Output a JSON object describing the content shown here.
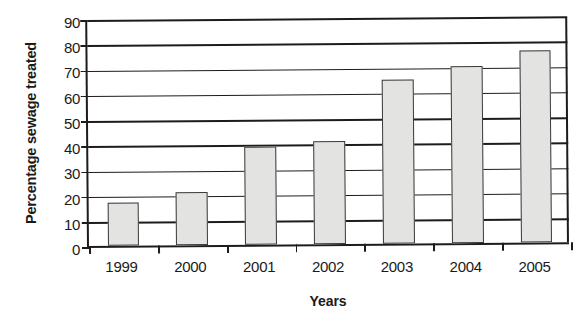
{
  "chart_data": {
    "type": "bar",
    "title": "",
    "xlabel": "Years",
    "ylabel": "Percentage sewage treated",
    "categories": [
      "1999",
      "2000",
      "2001",
      "2002",
      "2003",
      "2004",
      "2005"
    ],
    "values": [
      17,
      21,
      39,
      41,
      65,
      70,
      76
    ],
    "series": [
      {
        "name": "Percentage sewage treated",
        "values": [
          17,
          21,
          39,
          41,
          65,
          70,
          76
        ]
      }
    ],
    "ylim": [
      0,
      90
    ],
    "ytick_interval": 10,
    "yticks": [
      0,
      10,
      20,
      30,
      40,
      50,
      60,
      70,
      80,
      90
    ],
    "ytick_labels": [
      "0",
      "10",
      "20",
      "30",
      "40",
      "50",
      "60",
      "70",
      "80",
      "90"
    ],
    "grid": "horizontal",
    "legend": "none",
    "bar_fill_color": "#e3e3e1",
    "bar_edge_color": "#3a3a3a",
    "axis_color": "#1c1c1c",
    "background_color": "#ffffff"
  }
}
